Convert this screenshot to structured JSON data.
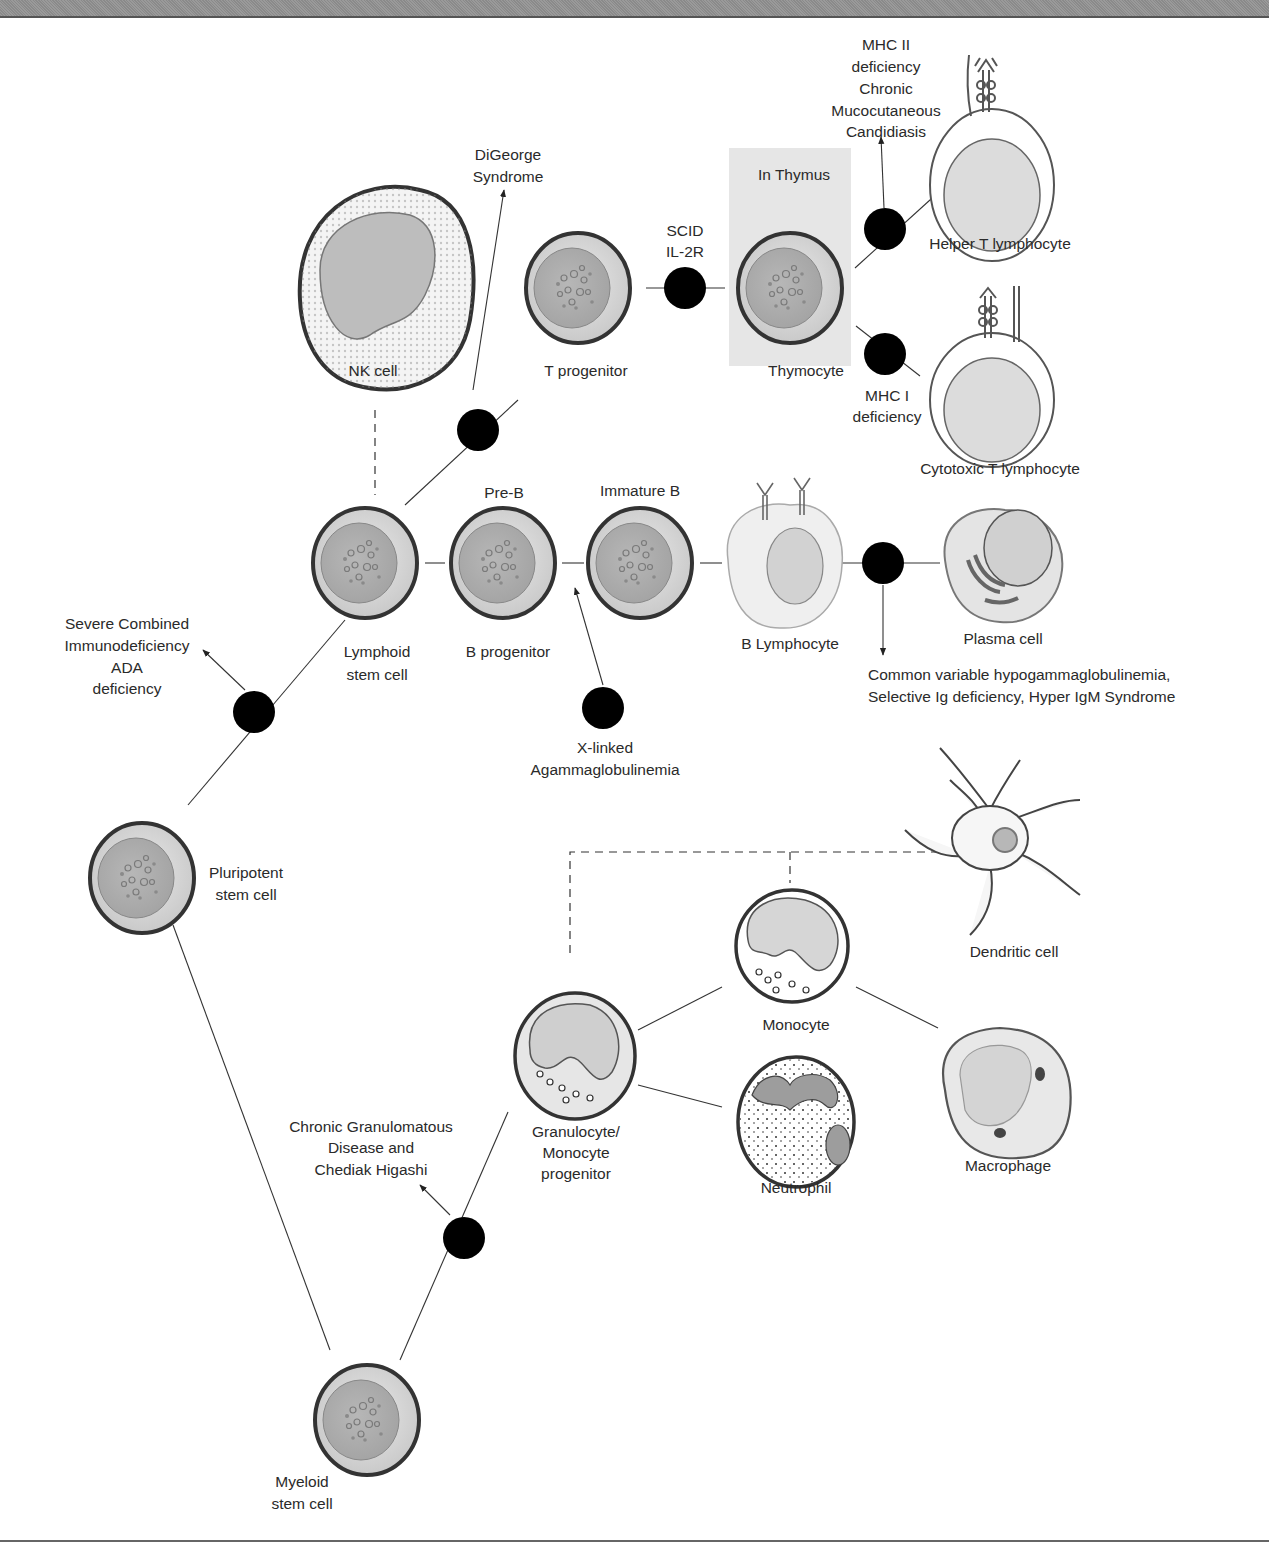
{
  "header": {
    "band_color": "#929292"
  },
  "region": {
    "thymus_label": "In Thymus"
  },
  "cells": {
    "nk": "NK cell",
    "t_progenitor": "T progenitor",
    "thymocyte": "Thymocyte",
    "helper_t": "Helper T lymphocyte",
    "cytotoxic_t": "Cytotoxic T lymphocyte",
    "lymphoid_stem": [
      "Lymphoid",
      "stem cell"
    ],
    "pre_b": "Pre-B",
    "b_progenitor": "B progenitor",
    "immature_b": "Immature B",
    "b_lymphocyte": "B Lymphocyte",
    "plasma": "Plasma cell",
    "pluripotent": [
      "Pluripotent",
      "stem cell"
    ],
    "dendritic": "Dendritic cell",
    "monocyte": "Monocyte",
    "macrophage": "Macrophage",
    "neutrophil": "Neutrophil",
    "gm_progenitor": [
      "Granulocyte/",
      "Monocyte",
      "progenitor"
    ],
    "myeloid_stem": [
      "Myeloid",
      "stem cell"
    ]
  },
  "defects": {
    "digeorge": [
      "DiGeorge",
      "Syndrome"
    ],
    "scid_il2r": [
      "SCID",
      "IL-2R"
    ],
    "mhc2": [
      "MHC II",
      "deficiency",
      "Chronic",
      "Mucocutaneous",
      "Candidiasis"
    ],
    "mhc1": [
      "MHC I",
      "deficiency"
    ],
    "scid_ada": [
      "Severe Combined",
      "Immunodeficiency",
      "ADA",
      "deficiency"
    ],
    "xla": [
      "X-linked",
      "Agammaglobulinemia"
    ],
    "cvid": [
      "Common variable hypogammaglobulinemia,",
      "Selective Ig deficiency, Hyper IgM Syndrome"
    ],
    "cgd": [
      "Chronic Granulomatous",
      "Disease and",
      "Chediak Higashi"
    ]
  }
}
